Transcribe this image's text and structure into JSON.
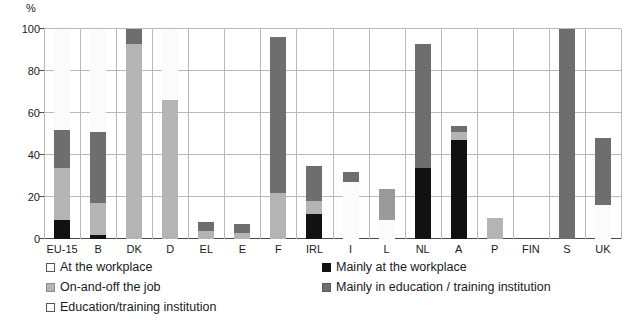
{
  "chart_data": {
    "type": "bar",
    "title": "",
    "subtitle": "",
    "xlabel": "",
    "ylabel": "%",
    "ylim": [
      0,
      100
    ],
    "yticks": [
      0,
      20,
      40,
      60,
      80,
      100
    ],
    "grid": true,
    "stacked": true,
    "legend_position": "below",
    "categories": [
      "EU-15",
      "B",
      "DK",
      "D",
      "EL",
      "E",
      "F",
      "IRL",
      "I",
      "L",
      "NL",
      "A",
      "P",
      "FIN",
      "S",
      "UK"
    ],
    "series": [
      {
        "name": "Mainly at the workplace",
        "color": "#111111",
        "values": [
          9,
          2,
          0,
          0,
          0,
          0,
          0,
          12,
          0,
          0,
          34,
          47,
          0,
          0,
          0,
          0
        ]
      },
      {
        "name": "On-and-off the job",
        "color": "#b4b4b4",
        "values": [
          25,
          15,
          93,
          66,
          4,
          3,
          22,
          6,
          0,
          9,
          0,
          4,
          10,
          0,
          0,
          16
        ]
      },
      {
        "name": "Mainly in education / training institution",
        "color": "#6e6e6e",
        "values": [
          18,
          34,
          7,
          0,
          4,
          4,
          74,
          17,
          5,
          15,
          59,
          3,
          0,
          0,
          100,
          32
        ]
      },
      {
        "name": "At the workplace",
        "color": "#ffffff",
        "values": [
          0,
          0,
          0,
          0,
          0,
          0,
          0,
          0,
          27,
          0,
          0,
          0,
          0,
          0,
          0,
          0
        ]
      },
      {
        "name": "Education/training institution",
        "color": "#ffffff",
        "values": [
          48,
          49,
          0,
          34,
          0,
          0,
          4,
          0,
          0,
          0,
          0,
          0,
          0,
          0,
          0,
          0
        ]
      }
    ],
    "bars": [
      {
        "category": "EU-15",
        "segments": [
          {
            "kind": "black",
            "from": 0,
            "to": 9
          },
          {
            "kind": "light",
            "from": 9,
            "to": 34
          },
          {
            "kind": "dark",
            "from": 34,
            "to": 52
          },
          {
            "kind": "white",
            "from": 52,
            "to": 100
          }
        ]
      },
      {
        "category": "B",
        "segments": [
          {
            "kind": "black",
            "from": 0,
            "to": 2
          },
          {
            "kind": "light",
            "from": 2,
            "to": 17
          },
          {
            "kind": "dark",
            "from": 17,
            "to": 51
          },
          {
            "kind": "white",
            "from": 51,
            "to": 100
          }
        ]
      },
      {
        "category": "DK",
        "segments": [
          {
            "kind": "light",
            "from": 0,
            "to": 93
          },
          {
            "kind": "dark",
            "from": 93,
            "to": 100
          }
        ]
      },
      {
        "category": "D",
        "segments": [
          {
            "kind": "light",
            "from": 0,
            "to": 66
          },
          {
            "kind": "white",
            "from": 66,
            "to": 100
          }
        ]
      },
      {
        "category": "EL",
        "segments": [
          {
            "kind": "light",
            "from": 0,
            "to": 4
          },
          {
            "kind": "dark",
            "from": 4,
            "to": 8
          }
        ]
      },
      {
        "category": "E",
        "segments": [
          {
            "kind": "light",
            "from": 0,
            "to": 3
          },
          {
            "kind": "dark",
            "from": 3,
            "to": 7
          }
        ]
      },
      {
        "category": "F",
        "segments": [
          {
            "kind": "light",
            "from": 0,
            "to": 22
          },
          {
            "kind": "dark",
            "from": 22,
            "to": 96
          }
        ]
      },
      {
        "category": "IRL",
        "segments": [
          {
            "kind": "black",
            "from": 0,
            "to": 12
          },
          {
            "kind": "light",
            "from": 12,
            "to": 18
          },
          {
            "kind": "dark",
            "from": 18,
            "to": 35
          }
        ]
      },
      {
        "category": "I",
        "segments": [
          {
            "kind": "white",
            "from": 0,
            "to": 27
          },
          {
            "kind": "dark",
            "from": 27,
            "to": 32
          }
        ]
      },
      {
        "category": "L",
        "segments": [
          {
            "kind": "white",
            "from": 0,
            "to": 9
          },
          {
            "kind": "mid",
            "from": 9,
            "to": 24
          }
        ]
      },
      {
        "category": "NL",
        "segments": [
          {
            "kind": "black",
            "from": 0,
            "to": 34
          },
          {
            "kind": "dark",
            "from": 34,
            "to": 93
          }
        ]
      },
      {
        "category": "A",
        "segments": [
          {
            "kind": "black",
            "from": 0,
            "to": 47
          },
          {
            "kind": "light",
            "from": 47,
            "to": 51
          },
          {
            "kind": "dark",
            "from": 51,
            "to": 54
          }
        ]
      },
      {
        "category": "P",
        "segments": [
          {
            "kind": "light",
            "from": 0,
            "to": 10
          }
        ]
      },
      {
        "category": "FIN",
        "segments": []
      },
      {
        "category": "S",
        "segments": [
          {
            "kind": "dark",
            "from": 0,
            "to": 100
          }
        ]
      },
      {
        "category": "UK",
        "segments": [
          {
            "kind": "white",
            "from": 0,
            "to": 16
          },
          {
            "kind": "dark",
            "from": 16,
            "to": 48
          }
        ]
      }
    ],
    "legend": [
      {
        "label": "At the workplace",
        "swatch": "white"
      },
      {
        "label": "Mainly at the workplace",
        "swatch": "black"
      },
      {
        "label": "On-and-off the job",
        "swatch": "light"
      },
      {
        "label": "Mainly in education / training institution",
        "swatch": "dark"
      },
      {
        "label": "Education/training institution",
        "swatch": "white"
      }
    ]
  }
}
